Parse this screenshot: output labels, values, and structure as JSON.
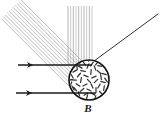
{
  "figure": {
    "background_color": "#ffffff",
    "width": 164,
    "height": 116
  },
  "labels": {
    "field_label": "B"
  },
  "colors": {
    "ink": "#1a1a1a",
    "ray_gray": "#9a9a9a",
    "ray_gray_light": "#b5b5b5",
    "circle_stroke": "#111111",
    "hatch": "#333333"
  },
  "field_region": {
    "name": "field-circle",
    "center_x": 89,
    "center_y": 80,
    "radius": 20,
    "stroke_width": 1.6,
    "fill": "#ffffff",
    "hatch_count": 46,
    "hatch_description": "randomly oriented short dashes filling the circle"
  },
  "incoming_arrows": [
    {
      "name": "upper-incoming-arrow",
      "x1": 18,
      "y1": 65,
      "x2": 92,
      "y2": 65,
      "arrowhead_x": 33,
      "direction": "right"
    },
    {
      "name": "lower-incoming-arrow",
      "x1": 16,
      "y1": 93,
      "x2": 96,
      "y2": 93,
      "arrowhead_x": 32,
      "direction": "right"
    }
  ],
  "outgoing_ray": {
    "name": "outgoing-upper-right-ray",
    "x1": 90,
    "y1": 64,
    "x2": 158,
    "y2": 14,
    "stroke_width": 0.9
  },
  "ray_bundles": [
    {
      "name": "diagonal-ray-bundle-upper-left",
      "orientation": "diagonal",
      "angle_degrees": 45,
      "count": 11,
      "converge_x": 90,
      "converge_y": 66,
      "start_offset_min": 4,
      "start_offset_max": 56,
      "length": 96,
      "stroke_width": 0.7
    },
    {
      "name": "vertical-ray-bundle-top",
      "orientation": "vertical",
      "angle_degrees": 90,
      "count": 10,
      "converge_x": 90,
      "converge_y": 64,
      "top_y": 6,
      "spread_x_min": 68,
      "spread_x_max": 92,
      "stroke_width": 0.7
    }
  ],
  "hatch_marks": [
    {
      "x": 80,
      "y": 67,
      "a": 28
    },
    {
      "x": 88,
      "y": 66,
      "a": 115
    },
    {
      "x": 95,
      "y": 68,
      "a": 70
    },
    {
      "x": 75,
      "y": 71,
      "a": 150
    },
    {
      "x": 83,
      "y": 71,
      "a": 10
    },
    {
      "x": 91,
      "y": 72,
      "a": 95
    },
    {
      "x": 99,
      "y": 72,
      "a": 40
    },
    {
      "x": 72,
      "y": 76,
      "a": 60
    },
    {
      "x": 79,
      "y": 75,
      "a": 130
    },
    {
      "x": 86,
      "y": 76,
      "a": 20
    },
    {
      "x": 94,
      "y": 77,
      "a": 160
    },
    {
      "x": 101,
      "y": 77,
      "a": 80
    },
    {
      "x": 74,
      "y": 80,
      "a": 5
    },
    {
      "x": 81,
      "y": 80,
      "a": 100
    },
    {
      "x": 89,
      "y": 81,
      "a": 45
    },
    {
      "x": 96,
      "y": 81,
      "a": 135
    },
    {
      "x": 103,
      "y": 82,
      "a": 15
    },
    {
      "x": 71,
      "y": 84,
      "a": 110
    },
    {
      "x": 78,
      "y": 85,
      "a": 35
    },
    {
      "x": 85,
      "y": 85,
      "a": 155
    },
    {
      "x": 92,
      "y": 86,
      "a": 65
    },
    {
      "x": 99,
      "y": 86,
      "a": 120
    },
    {
      "x": 75,
      "y": 89,
      "a": 50
    },
    {
      "x": 82,
      "y": 90,
      "a": 140
    },
    {
      "x": 89,
      "y": 90,
      "a": 25
    },
    {
      "x": 96,
      "y": 90,
      "a": 90
    },
    {
      "x": 79,
      "y": 94,
      "a": 75
    },
    {
      "x": 86,
      "y": 94,
      "a": 145
    },
    {
      "x": 93,
      "y": 94,
      "a": 30
    },
    {
      "x": 84,
      "y": 63,
      "a": 55
    },
    {
      "x": 92,
      "y": 64,
      "a": 125
    },
    {
      "x": 77,
      "y": 67,
      "a": 85
    },
    {
      "x": 100,
      "y": 66,
      "a": 12
    },
    {
      "x": 70,
      "y": 80,
      "a": 165
    },
    {
      "x": 106,
      "y": 80,
      "a": 55
    },
    {
      "x": 87,
      "y": 97,
      "a": 105
    },
    {
      "x": 78,
      "y": 62,
      "a": 42
    },
    {
      "x": 97,
      "y": 63,
      "a": 128
    },
    {
      "x": 104,
      "y": 74,
      "a": 18
    },
    {
      "x": 104,
      "y": 88,
      "a": 98
    },
    {
      "x": 73,
      "y": 88,
      "a": 62
    },
    {
      "x": 70,
      "y": 72,
      "a": 138
    },
    {
      "x": 81,
      "y": 98,
      "a": 22
    },
    {
      "x": 95,
      "y": 98,
      "a": 112
    },
    {
      "x": 88,
      "y": 59,
      "a": 72
    },
    {
      "x": 101,
      "y": 93,
      "a": 48
    }
  ]
}
